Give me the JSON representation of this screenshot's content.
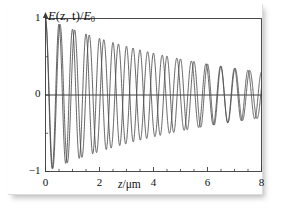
{
  "figure": {
    "background": "#ffffff",
    "frame_color": "#3a3a3a",
    "curve_color": "#4a4a4a"
  },
  "chart_data": {
    "type": "line",
    "title": "",
    "subtitle": "",
    "xlabel": "z/μm",
    "xlabel_symbol": "z",
    "xlabel_unit": "/μm",
    "ylabel": "E(z,t)/E₀",
    "ylabel_parts": {
      "field": "E",
      "args": "(z, t)",
      "slash": "/",
      "ref": "E",
      "ref_sub": "0"
    },
    "xlim": [
      0,
      8
    ],
    "ylim": [
      -1,
      1
    ],
    "xticks": [
      0,
      2,
      4,
      6,
      8
    ],
    "xticklabels": [
      "0",
      "2",
      "4",
      "6",
      "8"
    ],
    "xminorticks": [
      0.5,
      1,
      1.5,
      2.5,
      3,
      3.5,
      4.5,
      5,
      5.5,
      6.5,
      7,
      7.5
    ],
    "yticks": [
      -1,
      0,
      1
    ],
    "yticklabels": [
      "−1",
      "0",
      "1"
    ],
    "grid": false,
    "legend": null,
    "zero_line": true,
    "annotations": [],
    "envelope": {
      "type": "exponential_decay",
      "amplitude_at_x0": 1.0,
      "amplitude_at_x8": 0.3,
      "decay_constant_per_um": 0.1505
    },
    "series": [
      {
        "name": "wave-1",
        "color": "#4a4a4a",
        "amplitude": 1.0,
        "wavelength_um": 0.5,
        "phase_rad": 1.5708,
        "decay_constant_per_um": 0.1505,
        "npoints": 1800
      },
      {
        "name": "wave-2",
        "color": "#4a4a4a",
        "amplitude": 1.0,
        "wavelength_um": 0.5405,
        "phase_rad": 1.5708,
        "decay_constant_per_um": 0.1505,
        "npoints": 1800
      }
    ]
  }
}
